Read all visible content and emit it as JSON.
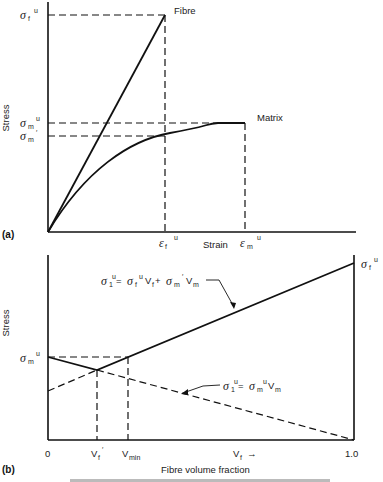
{
  "panel_a": {
    "tag": "(a)",
    "ylabel": "Stress",
    "xlabel": "Strain",
    "fibre_label": "Fibre",
    "matrix_label": "Matrix",
    "y_ticks": {
      "sigma_f_u": {
        "sym": "σ",
        "sub": "f",
        "sup": "u"
      },
      "sigma_m_u": {
        "sym": "σ",
        "sub": "m",
        "sup": "u"
      },
      "sigma_m_prime": {
        "sym": "σ",
        "sub": "m",
        "sup": "′"
      }
    },
    "x_ticks": {
      "eps_f_u": {
        "sym": "ε",
        "sub": "f",
        "sup": "u"
      },
      "eps_m_u": {
        "sym": "ε",
        "sub": "m",
        "sup": "u"
      }
    }
  },
  "panel_b": {
    "tag": "(b)",
    "ylabel": "Stress",
    "xlabel": "Fibre volume fraction",
    "y_ticks": {
      "sigma_m_u": {
        "sym": "σ",
        "sub": "m",
        "sup": "u"
      },
      "sigma_f_u": {
        "sym": "σ",
        "sub": "f",
        "sup": "u"
      }
    },
    "x_ticks": {
      "zero": "0",
      "vf_prime": "V",
      "vf_prime_sub": "f",
      "vf_prime_sup": "′",
      "vmin": "V",
      "vmin_sub": "min",
      "vf": "V",
      "vf_sub": "f",
      "vf_arrow": "→",
      "one": "1.0"
    },
    "eq_upper": {
      "lhs": "σ",
      "lhs_sub": "1",
      "lhs_sup": "u",
      "eq": " = ",
      "t1": "σ",
      "t1_sub": "f",
      "t1_sup": "u",
      "t1_v": "V",
      "t1_v_sub": "f",
      "plus": " + ",
      "t2": "σ",
      "t2_sub": "m",
      "t2_sup": "′",
      "t2_v": "V",
      "t2_v_sub": "m"
    },
    "eq_lower": {
      "lhs": "σ",
      "lhs_sub": "1",
      "lhs_sup": "u",
      "eq": " = ",
      "t1": "σ",
      "t1_sub": "m",
      "t1_sup": "u",
      "t1_v": "V",
      "t1_v_sub": "m"
    }
  },
  "caption": "Fig. — Fibre volume fraction (caption partially cut off)"
}
